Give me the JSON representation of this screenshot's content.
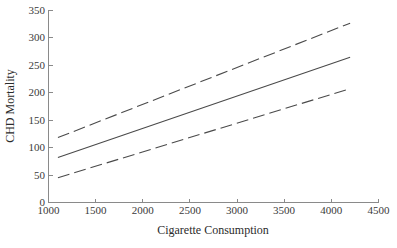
{
  "chart_data": {
    "type": "line",
    "title": "",
    "subtitle": "",
    "xlabel": "Cigarette Consumption",
    "ylabel": "CHD Mortality",
    "xlim": [
      1000,
      4500
    ],
    "ylim": [
      0,
      350
    ],
    "xticks": [
      1000,
      1500,
      2000,
      2500,
      3000,
      3500,
      4000,
      4500
    ],
    "xtick_labels": [
      "1000",
      "1500",
      "2000",
      "2500",
      "3000",
      "3500",
      "4000",
      "4500"
    ],
    "yticks": [
      0,
      50,
      100,
      150,
      200,
      250,
      300,
      350
    ],
    "ytick_labels": [
      "0",
      "50",
      "100",
      "150",
      "200",
      "250",
      "300",
      "350"
    ],
    "grid": false,
    "legend": "none",
    "x_domain_data": [
      1100,
      4200
    ],
    "series": [
      {
        "name": "Upper confidence band",
        "style": "dashed",
        "x": [
          1100,
          4200
        ],
        "values": [
          118,
          326
        ]
      },
      {
        "name": "Regression fit",
        "style": "solid",
        "x": [
          1100,
          4200
        ],
        "values": [
          82,
          264
        ]
      },
      {
        "name": "Lower confidence band",
        "style": "dashed",
        "x": [
          1100,
          4200
        ],
        "values": [
          45,
          207
        ]
      }
    ],
    "annotations": []
  }
}
